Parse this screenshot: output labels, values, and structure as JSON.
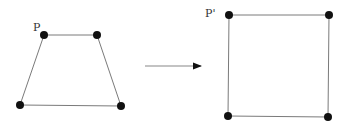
{
  "diagram": {
    "colors": {
      "line": "#7a7a7a",
      "point": "#111111",
      "label": "#333333",
      "arrow": "#888888"
    },
    "source_shape": {
      "label": "P",
      "points": [
        [
          44,
          35
        ],
        [
          97,
          35
        ],
        [
          121,
          106
        ],
        [
          20,
          105
        ]
      ]
    },
    "arrow": {
      "from": [
        145,
        66
      ],
      "to": [
        202,
        66
      ]
    },
    "target_shape": {
      "label": "P'",
      "points": [
        [
          229,
          15
        ],
        [
          329,
          15
        ],
        [
          328,
          117
        ],
        [
          228,
          116
        ]
      ]
    }
  }
}
